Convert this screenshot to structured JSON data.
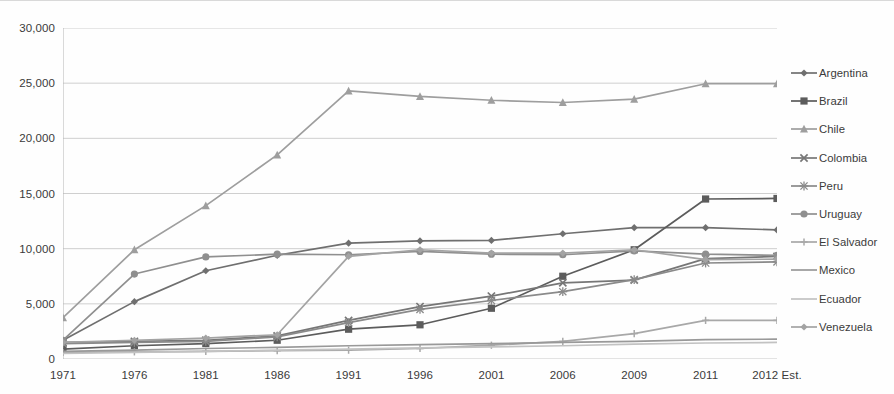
{
  "chart_data": {
    "type": "line",
    "title": "",
    "subtitle": "",
    "xlabel": "",
    "ylabel": "",
    "grid": true,
    "legend_position": "right",
    "ylim": [
      0,
      30000
    ],
    "ytick_labels": [
      "0",
      "5,000",
      "10,000",
      "15,000",
      "20,000",
      "25,000",
      "30,000"
    ],
    "ytick_values": [
      0,
      5000,
      10000,
      15000,
      20000,
      25000,
      30000
    ],
    "categories": [
      "1971",
      "1976",
      "1981",
      "1986",
      "1991",
      "1996",
      "2001",
      "2006",
      "2009",
      "2011",
      "2012 Est."
    ],
    "series": [
      {
        "name": "Argentina",
        "marker": "diamond",
        "color": "#6f6f6f",
        "values": [
          1700,
          5200,
          8000,
          9400,
          10500,
          10700,
          10750,
          11350,
          11900,
          11900,
          11700
        ]
      },
      {
        "name": "Brazil",
        "marker": "square",
        "color": "#5c5c5c",
        "values": [
          900,
          1200,
          1400,
          1700,
          2700,
          3100,
          4600,
          7500,
          9900,
          14500,
          14550
        ]
      },
      {
        "name": "Chile",
        "marker": "triangle",
        "color": "#9e9e9e",
        "values": [
          3750,
          9900,
          13900,
          18500,
          24300,
          23800,
          23450,
          23250,
          23550,
          24950,
          24950
        ]
      },
      {
        "name": "Colombia",
        "marker": "cross",
        "color": "#767676",
        "values": [
          1500,
          1600,
          1700,
          2100,
          3500,
          4750,
          5700,
          6900,
          7150,
          9100,
          9300
        ]
      },
      {
        "name": "Peru",
        "marker": "asterisk",
        "color": "#8a8a8a",
        "values": [
          1400,
          1500,
          1600,
          2000,
          3300,
          4500,
          5300,
          6100,
          7200,
          8700,
          8800
        ]
      },
      {
        "name": "Uruguay",
        "marker": "circle",
        "color": "#8f8f8f",
        "values": [
          1700,
          7700,
          9250,
          9500,
          9450,
          9750,
          9500,
          9450,
          9800,
          9500,
          9400
        ]
      },
      {
        "name": "El Salvador",
        "marker": "plus",
        "color": "#a8a8a8",
        "values": [
          600,
          650,
          700,
          750,
          800,
          950,
          1250,
          1600,
          2300,
          3500,
          3500
        ]
      },
      {
        "name": "Mexico",
        "marker": "none",
        "color": "#999999",
        "values": [
          700,
          800,
          950,
          1050,
          1200,
          1300,
          1400,
          1500,
          1600,
          1750,
          1800
        ]
      },
      {
        "name": "Ecuador",
        "marker": "none",
        "color": "#c2c2c2",
        "values": [
          500,
          600,
          700,
          800,
          900,
          1000,
          1100,
          1200,
          1350,
          1450,
          1500
        ]
      },
      {
        "name": "Venezuela",
        "marker": "diamond",
        "color": "#a3a3a3",
        "values": [
          1500,
          1700,
          1900,
          2200,
          9300,
          9900,
          9600,
          9600,
          9900,
          9000,
          9050
        ]
      }
    ]
  }
}
